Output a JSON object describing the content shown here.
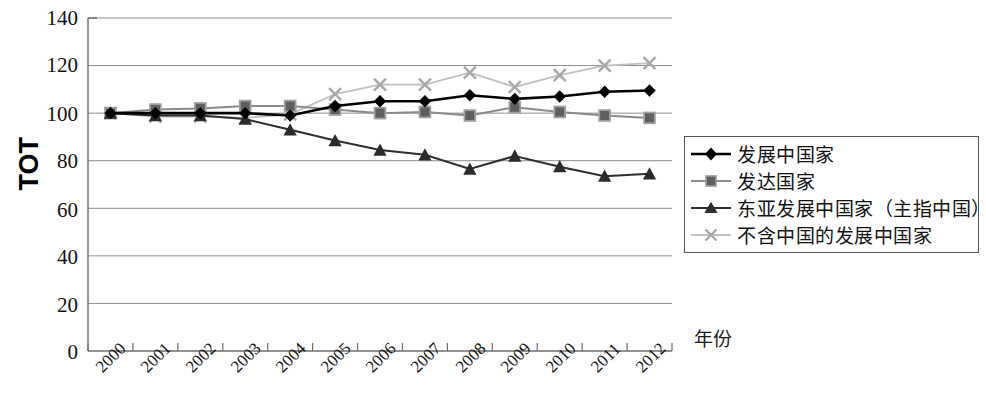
{
  "chart_data": {
    "type": "line",
    "title": "",
    "xlabel": "年份",
    "ylabel": "TOT",
    "categories": [
      "2000",
      "2001",
      "2002",
      "2003",
      "2004",
      "2005",
      "2006",
      "2007",
      "2008",
      "2009",
      "2010",
      "2011",
      "2012"
    ],
    "ylim": [
      0,
      140
    ],
    "yticks": [
      0,
      20,
      40,
      60,
      80,
      100,
      120,
      140
    ],
    "grid": true,
    "legend_position": "right",
    "series": [
      {
        "name": "发展中国家",
        "marker": "diamond",
        "color": "#000000",
        "values": [
          100,
          100,
          100,
          100,
          99,
          103,
          105,
          105,
          107.5,
          106,
          107,
          109,
          109.5
        ]
      },
      {
        "name": "发达国家",
        "marker": "square",
        "color": "#707070",
        "values": [
          100,
          101.5,
          102,
          103,
          103,
          101.5,
          100,
          100.5,
          99,
          102.5,
          100.5,
          99,
          98
        ]
      },
      {
        "name": "东亚发展中国家（主指中国）",
        "marker": "triangle",
        "color": "#383838",
        "values": [
          100,
          99,
          99,
          97.5,
          93,
          88.5,
          84.5,
          82.5,
          76.5,
          82,
          77.5,
          73.5,
          74.5
        ]
      },
      {
        "name": "不含中国的发展中国家",
        "marker": "x",
        "color": "#b5b5b5",
        "values": [
          100,
          98.5,
          98.5,
          98,
          99.5,
          108,
          112,
          112,
          117,
          111,
          116,
          120,
          121
        ]
      }
    ]
  },
  "axis": {
    "y_tick_labels": [
      "140",
      "120",
      "100",
      "80",
      "60",
      "40",
      "20",
      "0"
    ],
    "x_tick_labels": [
      "2000",
      "2001",
      "2002",
      "2003",
      "2004",
      "2005",
      "2006",
      "2007",
      "2008",
      "2009",
      "2010",
      "2011",
      "2012"
    ],
    "y_axis_title": "TOT",
    "x_axis_title": "年份"
  },
  "legend": {
    "items": [
      {
        "label": "发展中国家"
      },
      {
        "label": "发达国家"
      },
      {
        "label": "东亚发展中国家（主指中国）"
      },
      {
        "label": "不含中国的发展中国家"
      }
    ]
  }
}
